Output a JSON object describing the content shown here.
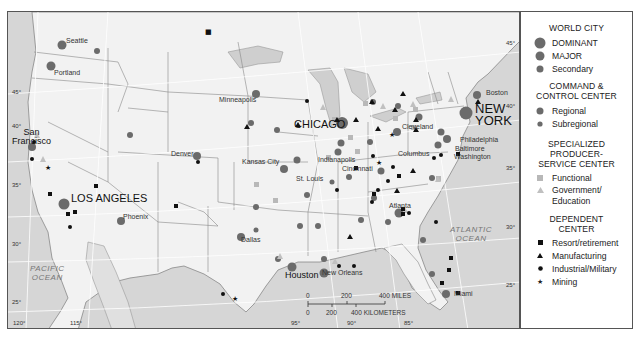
{
  "map": {
    "oceans": [
      {
        "label": "PACIFIC\nOCEAN",
        "line1": "PACIFIC",
        "line2": "OCEAN"
      },
      {
        "label": "ATLANTIC\nOCEAN",
        "line1": "ATLANTIC",
        "line2": "OCEAN"
      }
    ],
    "latitudes": [
      "45°",
      "40°",
      "35°",
      "30°",
      "25°",
      "45°",
      "40°",
      "35°",
      "30°",
      "25°"
    ],
    "longitudes": [
      "120°",
      "115°",
      "95°",
      "90°",
      "85°"
    ],
    "cities": {
      "seattle": "Seattle",
      "portland": "Portland",
      "san_francisco_1": "San",
      "san_francisco_2": "Francisco",
      "los_angeles": "LOS ANGELES",
      "phoenix": "Phoenix",
      "denver": "Denver",
      "minneapolis": "Minneapolis",
      "chicago": "CHICAGO",
      "kansas_city": "Kansas City",
      "st_louis": "St. Louis",
      "indianapolis": "Indianapolis",
      "cincinnati": "Cincinnati",
      "cleveland": "Cleveland",
      "columbus": "Columbus",
      "boston": "Boston",
      "new_york_1": "NEW",
      "new_york_2": "YORK",
      "philadelphia": "Philadelphia",
      "baltimore": "Baltimore",
      "washington": "Washington",
      "atlanta": "Atlanta",
      "dallas": "Dallas",
      "houston": "Houston",
      "new_orleans": "New Orleans",
      "miami": "Miami"
    },
    "scale": {
      "miles_ticks": [
        "0",
        "200",
        "400 MILES"
      ],
      "km_ticks": [
        "0",
        "200",
        "400 KILOMETERS"
      ]
    }
  },
  "legend": {
    "world_city": {
      "title": "WORLD CITY",
      "items": [
        "DOMINANT",
        "MAJOR",
        "Secondary"
      ]
    },
    "command_control": {
      "title_1": "COMMAND &",
      "title_2": "CONTROL CENTER",
      "items": [
        "Regional",
        "Subregional"
      ]
    },
    "specialized": {
      "title_1": "SPECIALIZED",
      "title_2": "PRODUCER-",
      "title_3": "SERVICE CENTER",
      "items": [
        "Functional",
        "Government/",
        "Education"
      ]
    },
    "dependent": {
      "title_1": "DEPENDENT",
      "title_2": "CENTER",
      "items": [
        "Resort/retirement",
        "Manufacturing",
        "Industrial/Military",
        "Mining"
      ]
    }
  },
  "colors": {
    "land": "#f2f2f2",
    "water": "#d6d6d6",
    "city_dot": "#6b6b6b",
    "functional": "#b8b8b8",
    "dependent": "#111111"
  }
}
